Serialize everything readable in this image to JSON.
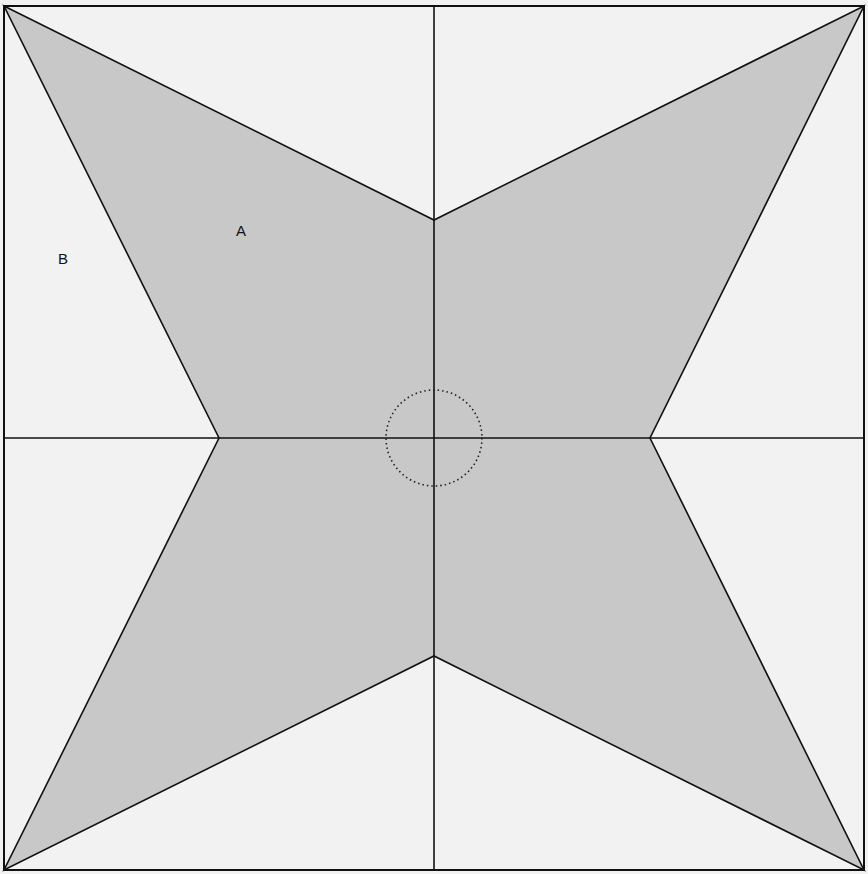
{
  "diagram": {
    "type": "geometric-figure",
    "colors": {
      "background": "#f2f2f2",
      "shaded_region": "#c8c8c8",
      "lines": "#111111",
      "circle": "#222222"
    },
    "square": {
      "x": 4,
      "y": 6,
      "width": 860,
      "height": 864
    },
    "center": {
      "x": 434,
      "y": 438
    },
    "star_vertices": [
      {
        "x": 4,
        "y": 6
      },
      {
        "x": 434,
        "y": 220
      },
      {
        "x": 864,
        "y": 6
      },
      {
        "x": 650,
        "y": 438
      },
      {
        "x": 864,
        "y": 870
      },
      {
        "x": 434,
        "y": 656
      },
      {
        "x": 4,
        "y": 870
      },
      {
        "x": 219,
        "y": 438
      }
    ],
    "center_circle": {
      "cx": 434,
      "cy": 438,
      "r": 48,
      "style": "dotted"
    },
    "labels": [
      {
        "text": "A",
        "x": 241,
        "y": 236,
        "region": "shaded star region"
      },
      {
        "text": "B",
        "x": 63,
        "y": 264,
        "region": "unshaded region"
      }
    ]
  }
}
